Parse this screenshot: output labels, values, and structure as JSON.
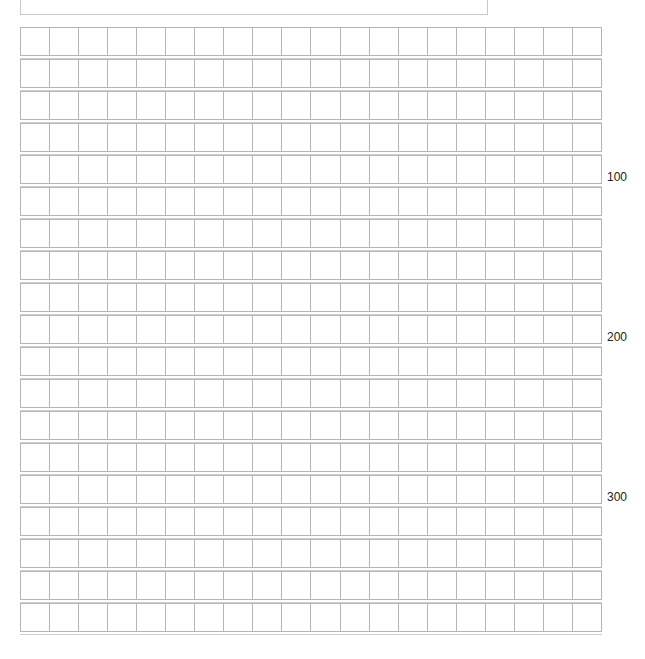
{
  "sheet": {
    "type": "manuscript-grid-paper",
    "header_text": "",
    "rows": 19,
    "columns": 20,
    "line_color": "#b5b5b5",
    "markers": [
      {
        "label": "100",
        "after_row": 5
      },
      {
        "label": "200",
        "after_row": 10
      },
      {
        "label": "300",
        "after_row": 15
      }
    ]
  }
}
